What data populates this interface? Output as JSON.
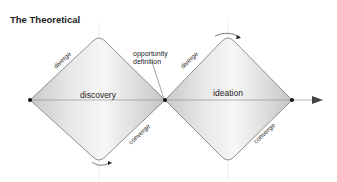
{
  "title": "The Theoretical",
  "labels": {
    "opportunity_line1": "opportunity",
    "opportunity_line2": "definition",
    "discovery": "discovery",
    "ideation": "ideation",
    "diverge_left": "diverge",
    "converge_left": "converge",
    "diverge_right": "diverge",
    "converge_right": "converge"
  }
}
